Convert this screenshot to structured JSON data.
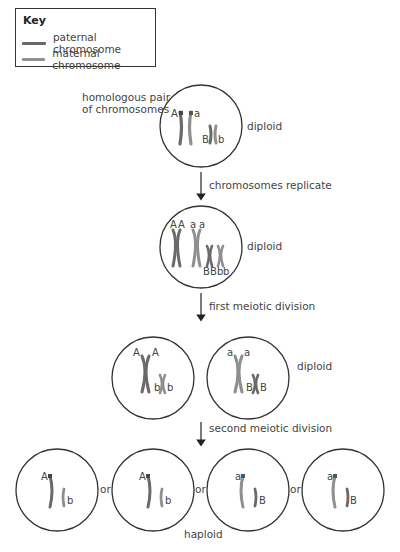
{
  "key": {
    "title": "Key",
    "items": [
      {
        "label": "paternal chromosome",
        "color": "#6a6a6a"
      },
      {
        "label": "maternal chromosome",
        "color": "#8f8f8f"
      }
    ]
  },
  "stages": {
    "stage1": {
      "caption": "homologous pair",
      "caption2": "of chromosomes",
      "ploidy": "diploid",
      "alleles": [
        "A",
        "a",
        "B",
        "b"
      ]
    },
    "step1": {
      "label": "chromosomes replicate"
    },
    "stage2": {
      "ploidy": "diploid",
      "alleles_top": [
        "A",
        "A",
        "a",
        "a"
      ],
      "alleles_bottom": [
        "B",
        "B",
        "b",
        "b"
      ]
    },
    "step2": {
      "label": "first meiotic division"
    },
    "stage3": {
      "ploidy": "diploid",
      "cells": [
        {
          "top": [
            "A",
            "A"
          ],
          "bottom": [
            "b",
            "b"
          ]
        },
        {
          "top": [
            "a",
            "a"
          ],
          "bottom": [
            "B",
            "B"
          ]
        }
      ]
    },
    "step3": {
      "label": "second meiotic division"
    },
    "stage4": {
      "ploidy": "haploid",
      "separator": "or",
      "cells": [
        {
          "allele1": "A",
          "allele2": "b"
        },
        {
          "allele1": "A",
          "allele2": "b"
        },
        {
          "allele1": "a",
          "allele2": "B"
        },
        {
          "allele1": "a",
          "allele2": "B"
        }
      ]
    }
  },
  "colors": {
    "paternal": "#6a6a6a",
    "maternal": "#8f8f8f",
    "outline": "#333333"
  }
}
